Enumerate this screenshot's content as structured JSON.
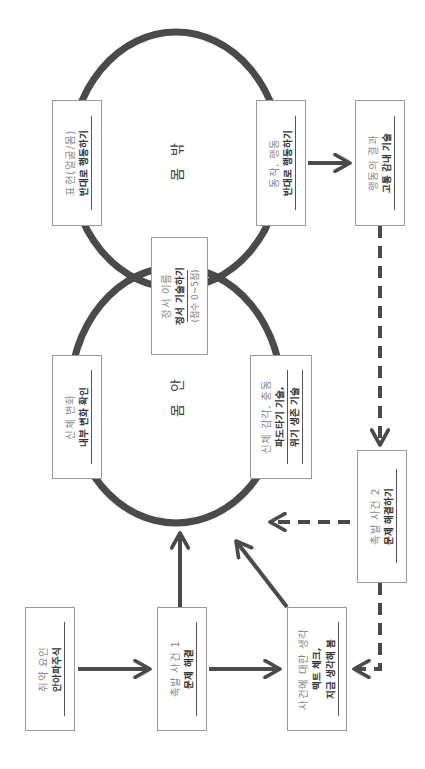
{
  "diagram": {
    "orientation": "rotated-90-ccw",
    "circles": {
      "inside_body": {
        "label": "몸 안"
      },
      "outside_body": {
        "label": "몸 밖"
      }
    },
    "boxes": {
      "vulnerability": {
        "title": "취약 요인",
        "skill": "안아파주식"
      },
      "trigger1": {
        "title": "촉발 사건 1",
        "skill": "문제 해결"
      },
      "thoughts": {
        "title": "사건에 대한 생각",
        "skill_line1": "팩트 체크,",
        "skill_line2": "지금 생각해 봄"
      },
      "body_change": {
        "title": "신체 변화",
        "skill": "내부 변화 확인"
      },
      "sensation": {
        "title": "신체 감각, 충동",
        "skill_line1": "파도타기 기술,",
        "skill_line2": "위기 생존 기술"
      },
      "emotion_name": {
        "title": "정서 이름",
        "skill": "정서 기술하기",
        "sub": "(점수 0~5점)"
      },
      "expression": {
        "title": "표현(얼굴/몸)",
        "skill": "반대로 행동하기"
      },
      "action": {
        "title": "동작, 행동",
        "skill": "반대로 행동하기"
      },
      "result": {
        "title": "행동의 결과",
        "skill": "고통 감내 기술"
      },
      "trigger2": {
        "title": "촉발 사건 2",
        "skill": "문제 해결하기"
      }
    },
    "arrows": [
      {
        "from": "vulnerability",
        "to": "trigger1",
        "style": "solid"
      },
      {
        "from": "trigger1",
        "to": "thoughts",
        "style": "solid"
      },
      {
        "from": "trigger1",
        "to": "inside_body",
        "style": "solid"
      },
      {
        "from": "thoughts",
        "to": "inside_body",
        "style": "solid"
      },
      {
        "from": "action",
        "to": "result",
        "style": "solid"
      },
      {
        "from": "result",
        "to": "trigger2",
        "style": "dashed"
      },
      {
        "from": "trigger2",
        "to": "inside_body",
        "style": "dashed"
      },
      {
        "from": "trigger2",
        "to": "thoughts",
        "style": "dashed"
      }
    ],
    "colors": {
      "stroke": "#4a4a4a",
      "box_border": "#9a9a9a",
      "title_text": "#8a8a8a",
      "skill_text": "#333333"
    }
  }
}
